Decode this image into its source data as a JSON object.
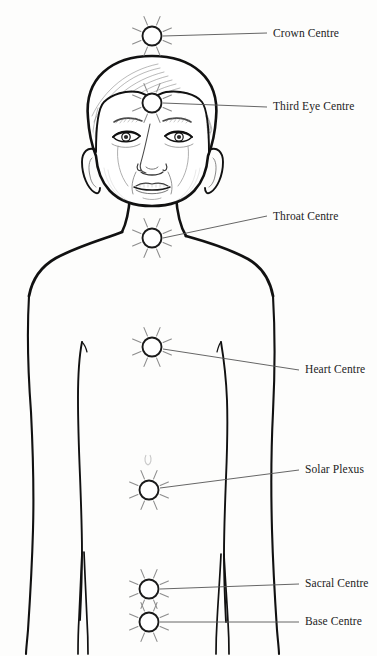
{
  "diagram": {
    "background_color": "#fdfdfc",
    "outline_color": "#111111",
    "leader_line_color": "#555555",
    "marker_stroke_color": "#1a1a1a",
    "marker_fill_color": "#ffffff",
    "label_color": "#232323"
  },
  "centres": [
    {
      "id": "crown",
      "label": "Crown Centre",
      "marker": {
        "cx": 152,
        "cy": 36,
        "r": 9.5,
        "rays": 8,
        "ray_inner": 12,
        "ray_outer": 21
      },
      "leader": {
        "x1": 163,
        "y1": 36,
        "x2": 267,
        "y2": 33
      },
      "label_pos": {
        "x": 273,
        "y": 28
      }
    },
    {
      "id": "third-eye",
      "label": "Third Eye Centre",
      "marker": {
        "cx": 152,
        "cy": 103,
        "r": 9.5,
        "rays": 8,
        "ray_inner": 12,
        "ray_outer": 21
      },
      "leader": {
        "x1": 163,
        "y1": 103,
        "x2": 267,
        "y2": 107
      },
      "label_pos": {
        "x": 273,
        "y": 101
      }
    },
    {
      "id": "throat",
      "label": "Throat Centre",
      "marker": {
        "cx": 152,
        "cy": 238,
        "r": 9.5,
        "rays": 8,
        "ray_inner": 12,
        "ray_outer": 21
      },
      "leader": {
        "x1": 163,
        "y1": 238,
        "x2": 267,
        "y2": 216
      },
      "label_pos": {
        "x": 273,
        "y": 211
      }
    },
    {
      "id": "heart",
      "label": "Heart Centre",
      "marker": {
        "cx": 152,
        "cy": 347,
        "r": 9.5,
        "rays": 8,
        "ray_inner": 12,
        "ray_outer": 21
      },
      "leader": {
        "x1": 163,
        "y1": 349,
        "x2": 299,
        "y2": 370
      },
      "label_pos": {
        "x": 305,
        "y": 364
      }
    },
    {
      "id": "solar-plexus",
      "label": "Solar Plexus",
      "marker": {
        "cx": 149,
        "cy": 490,
        "r": 9.5,
        "rays": 8,
        "ray_inner": 12,
        "ray_outer": 21
      },
      "leader": {
        "x1": 160,
        "y1": 488,
        "x2": 299,
        "y2": 470
      },
      "label_pos": {
        "x": 305,
        "y": 464
      }
    },
    {
      "id": "sacral",
      "label": "Sacral Centre",
      "marker": {
        "cx": 149,
        "cy": 589,
        "r": 9.5,
        "rays": 8,
        "ray_inner": 12,
        "ray_outer": 21
      },
      "leader": {
        "x1": 160,
        "y1": 589,
        "x2": 299,
        "y2": 584
      },
      "label_pos": {
        "x": 305,
        "y": 578
      }
    },
    {
      "id": "base",
      "label": "Base Centre",
      "marker": {
        "cx": 149,
        "cy": 622,
        "r": 9.5,
        "rays": 8,
        "ray_inner": 12,
        "ray_outer": 21
      },
      "leader": {
        "x1": 160,
        "y1": 622,
        "x2": 299,
        "y2": 622
      },
      "label_pos": {
        "x": 305,
        "y": 616
      }
    }
  ]
}
